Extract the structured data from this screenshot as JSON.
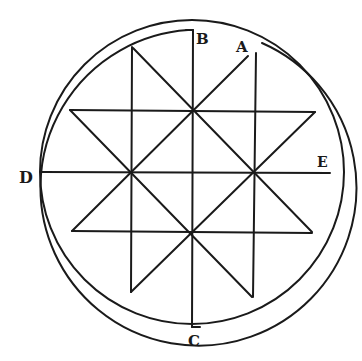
{
  "diagram": {
    "labels": {
      "A": "A",
      "B": "B",
      "C": "C",
      "D": "D",
      "E": "E"
    },
    "colors": {
      "ink": "#1a1a1a",
      "paper": "#ffffff"
    }
  }
}
